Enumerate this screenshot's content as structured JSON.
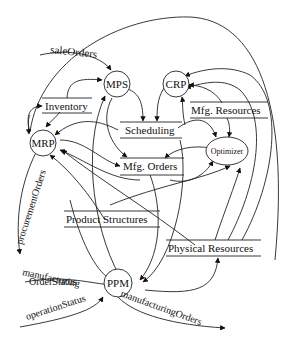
{
  "diagram": {
    "type": "data-flow-diagram",
    "processes": [
      {
        "id": "mps",
        "label": "MPS"
      },
      {
        "id": "crp",
        "label": "CRP"
      },
      {
        "id": "mrp",
        "label": "MRP"
      },
      {
        "id": "optimizer",
        "label": "Optimizer"
      },
      {
        "id": "ppm",
        "label": "PPM"
      }
    ],
    "stores": [
      {
        "id": "inventory",
        "label": "Inventory"
      },
      {
        "id": "mfg_resources",
        "label": "Mfg. Resources"
      },
      {
        "id": "scheduling",
        "label": "Scheduling"
      },
      {
        "id": "mfg_orders",
        "label": "Mfg. Orders"
      },
      {
        "id": "product_structures",
        "label": "Product Structures"
      },
      {
        "id": "physical_resources",
        "label": "Physical Resources"
      }
    ],
    "flows": [
      {
        "id": "sale_orders",
        "label": "saleOrders"
      },
      {
        "id": "procurement_orders",
        "label": "procurementOrders"
      },
      {
        "id": "manufacturing_order_status",
        "label_line1": "manufacturing",
        "label_line2": "OrderStatus"
      },
      {
        "id": "operation_status",
        "label": "operationStatus"
      },
      {
        "id": "manufacturing_orders",
        "label": "manufacturingOrders"
      }
    ]
  }
}
